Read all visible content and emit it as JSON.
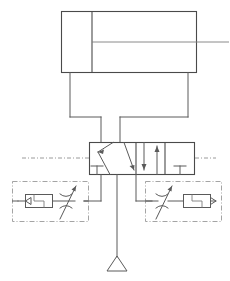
{
  "diagram": {
    "type": "pneumatic-circuit-schematic",
    "colors": {
      "line": "#5a5a5a",
      "line_light": "#7d7d7d",
      "body": "#4a4a4a",
      "envelope": "#9a9a9a",
      "background": "#ffffff"
    },
    "components": [
      {
        "id": "cylinder",
        "name": "double-acting-cylinder",
        "label": "",
        "x": 61,
        "y": 11,
        "width": 136,
        "height": 62,
        "piston_x": 92,
        "rod_y": 42,
        "rod_end_x": 229,
        "port_a_x": 70,
        "port_b_x": 188
      },
      {
        "id": "valve",
        "name": "directional-control-valve",
        "label": "",
        "x": 89,
        "y": 142,
        "width": 106,
        "height": 33,
        "positions": 3,
        "boxes": [
          {
            "kind": "crossed",
            "x": 89,
            "width": 47
          },
          {
            "kind": "parallel",
            "x": 136,
            "width": 29
          },
          {
            "kind": "blocked",
            "x": 165,
            "width": 30
          }
        ]
      },
      {
        "id": "flow-control-left",
        "name": "flow-control-valve-left",
        "label": "",
        "x": 12,
        "y": 181,
        "width": 77,
        "height": 41,
        "check_direction": "left",
        "restrictor": "adjustable"
      },
      {
        "id": "flow-control-right",
        "name": "flow-control-valve-right",
        "label": "",
        "x": 145,
        "y": 181,
        "width": 77,
        "height": 41,
        "check_direction": "right",
        "restrictor": "adjustable"
      },
      {
        "id": "exhaust",
        "name": "exhaust-port",
        "label": "",
        "x": 117,
        "y": 256,
        "width": 22,
        "height": 15
      }
    ],
    "pilot_lines": [
      {
        "name": "pilot-line-left",
        "x1": 22,
        "y1": 158,
        "x2": 89,
        "y2": 158
      },
      {
        "name": "pilot-line-right",
        "x1": 195,
        "y1": 158,
        "x2": 214,
        "y2": 158
      }
    ]
  }
}
